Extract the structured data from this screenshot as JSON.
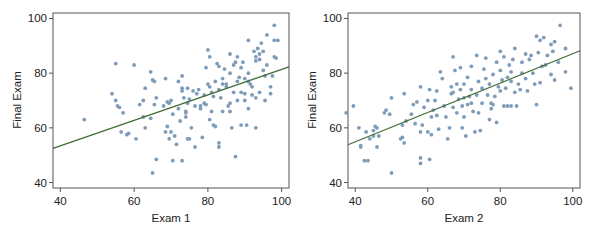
{
  "chart_data": [
    {
      "type": "scatter",
      "title": "",
      "xlabel": "Exam 1",
      "ylabel": "Final Exam",
      "xlim": [
        38,
        102
      ],
      "ylim": [
        38,
        102
      ],
      "xticks": [
        40,
        60,
        80,
        100
      ],
      "yticks": [
        40,
        60,
        80,
        100
      ],
      "grid": false,
      "legend": null,
      "point_color": "#7e9cb8",
      "line_color": "#3f6b35",
      "regression_line": {
        "x": [
          38,
          102
        ],
        "y": [
          52.5,
          82.3
        ]
      },
      "points": [
        [
          46.5,
          63
        ],
        [
          54,
          72.5
        ],
        [
          55,
          83.5
        ],
        [
          55,
          70
        ],
        [
          55.5,
          68
        ],
        [
          56,
          67.5
        ],
        [
          57,
          65.5
        ],
        [
          56.5,
          58.5
        ],
        [
          58,
          57.5
        ],
        [
          58.5,
          58
        ],
        [
          60,
          83
        ],
        [
          60.5,
          56
        ],
        [
          61.5,
          68.5
        ],
        [
          62.5,
          64
        ],
        [
          62.5,
          70
        ],
        [
          63,
          74.5
        ],
        [
          63,
          60
        ],
        [
          64.5,
          80.5
        ],
        [
          65,
          77.5
        ],
        [
          65.5,
          77
        ],
        [
          64.5,
          63.5
        ],
        [
          65.5,
          68.5
        ],
        [
          66,
          71
        ],
        [
          66,
          48.5
        ],
        [
          65,
          43.5
        ],
        [
          68,
          68
        ],
        [
          68.5,
          78
        ],
        [
          69,
          69.5
        ],
        [
          69.5,
          69
        ],
        [
          70,
          70
        ],
        [
          68.5,
          58.5
        ],
        [
          69,
          60.5
        ],
        [
          69.5,
          56
        ],
        [
          70,
          58.5
        ],
        [
          70.5,
          65
        ],
        [
          70.5,
          48
        ],
        [
          71,
          57
        ],
        [
          71.5,
          54
        ],
        [
          72,
          67
        ],
        [
          72,
          77
        ],
        [
          72.5,
          62.5
        ],
        [
          73,
          79
        ],
        [
          73,
          73.5
        ],
        [
          73,
          74.5
        ],
        [
          73.5,
          71
        ],
        [
          74,
          66
        ],
        [
          74,
          65.5
        ],
        [
          74.5,
          69
        ],
        [
          74.5,
          74.5
        ],
        [
          74,
          64
        ],
        [
          73,
          48
        ],
        [
          74.5,
          56
        ],
        [
          75,
          56
        ],
        [
          75.5,
          60
        ],
        [
          75,
          70.5
        ],
        [
          76,
          73.5
        ],
        [
          76.5,
          68
        ],
        [
          76.5,
          53
        ],
        [
          77,
          72.5
        ],
        [
          77.5,
          74
        ],
        [
          78,
          68
        ],
        [
          78.5,
          56.5
        ],
        [
          78,
          67
        ],
        [
          79,
          69
        ],
        [
          79.5,
          82
        ],
        [
          79,
          72
        ],
        [
          79.5,
          68.5
        ],
        [
          80,
          88.5
        ],
        [
          80,
          76
        ],
        [
          80.5,
          86
        ],
        [
          80.5,
          75
        ],
        [
          80.5,
          63
        ],
        [
          81,
          73
        ],
        [
          81,
          66
        ],
        [
          81.5,
          71.5
        ],
        [
          81.5,
          61
        ],
        [
          82,
          77
        ],
        [
          82,
          60.5
        ],
        [
          82.5,
          83.5
        ],
        [
          83,
          74
        ],
        [
          83,
          82.5
        ],
        [
          83,
          53
        ],
        [
          83,
          54.5
        ],
        [
          83.5,
          71
        ],
        [
          84,
          78
        ],
        [
          84,
          76
        ],
        [
          84,
          66
        ],
        [
          84.5,
          81.5
        ],
        [
          85,
          76
        ],
        [
          85,
          75
        ],
        [
          85.5,
          68
        ],
        [
          86,
          87
        ],
        [
          86,
          80
        ],
        [
          86,
          69
        ],
        [
          86,
          66
        ],
        [
          86.5,
          60
        ],
        [
          87,
          83
        ],
        [
          87,
          73
        ],
        [
          87.5,
          84
        ],
        [
          87.5,
          49.5
        ],
        [
          88,
          86
        ],
        [
          88,
          77
        ],
        [
          88,
          70
        ],
        [
          88.5,
          78.5
        ],
        [
          89,
          82
        ],
        [
          89,
          73
        ],
        [
          89,
          61
        ],
        [
          89.5,
          84
        ],
        [
          90,
          78
        ],
        [
          90,
          72.5
        ],
        [
          90,
          70
        ],
        [
          90.5,
          61
        ],
        [
          91,
          92
        ],
        [
          91,
          80
        ],
        [
          91,
          77
        ],
        [
          91,
          67
        ],
        [
          91.5,
          76
        ],
        [
          92,
          75
        ],
        [
          92,
          72
        ],
        [
          92.5,
          88
        ],
        [
          93,
          86
        ],
        [
          93,
          84.5
        ],
        [
          93,
          71
        ],
        [
          93,
          60
        ],
        [
          93.5,
          89
        ],
        [
          94,
          87
        ],
        [
          94,
          85
        ],
        [
          94,
          73
        ],
        [
          94.5,
          91
        ],
        [
          95,
          88
        ],
        [
          95,
          81
        ],
        [
          95.5,
          79
        ],
        [
          95.5,
          70
        ],
        [
          96,
          94
        ],
        [
          96,
          83
        ],
        [
          97,
          72.5
        ],
        [
          97,
          75
        ],
        [
          97.5,
          79
        ],
        [
          98,
          97.5
        ],
        [
          98,
          86
        ],
        [
          98,
          92
        ],
        [
          98.5,
          85.5
        ],
        [
          99,
          92
        ]
      ]
    },
    {
      "type": "scatter",
      "title": "",
      "xlabel": "Exam 2",
      "ylabel": "Final Exam",
      "xlim": [
        38,
        102
      ],
      "ylim": [
        38,
        102
      ],
      "xticks": [
        40,
        60,
        80,
        100
      ],
      "yticks": [
        40,
        60,
        80,
        100
      ],
      "grid": false,
      "legend": null,
      "point_color": "#7e9cb8",
      "line_color": "#3f6b35",
      "regression_line": {
        "x": [
          38,
          102
        ],
        "y": [
          53.8,
          88.2
        ]
      },
      "points": [
        [
          37.5,
          65.5
        ],
        [
          39.5,
          68
        ],
        [
          41,
          60
        ],
        [
          41.5,
          53.5
        ],
        [
          41.5,
          53
        ],
        [
          42.5,
          48
        ],
        [
          43,
          58.5
        ],
        [
          43.5,
          48
        ],
        [
          44,
          56
        ],
        [
          45,
          57
        ],
        [
          45,
          59
        ],
        [
          45.5,
          60.5
        ],
        [
          46,
          60
        ],
        [
          46,
          53
        ],
        [
          46.5,
          57
        ],
        [
          48,
          65.5
        ],
        [
          48.5,
          66.5
        ],
        [
          49.5,
          65
        ],
        [
          50,
          71
        ],
        [
          50,
          43.5
        ],
        [
          52.5,
          56
        ],
        [
          53,
          61
        ],
        [
          53,
          56.5
        ],
        [
          53.5,
          72.5
        ],
        [
          53.5,
          54.5
        ],
        [
          54,
          62.5
        ],
        [
          55.5,
          65
        ],
        [
          56,
          68.5
        ],
        [
          56.5,
          61.5
        ],
        [
          57,
          69.5
        ],
        [
          58,
          75
        ],
        [
          58,
          49
        ],
        [
          58,
          47
        ],
        [
          58,
          58.5
        ],
        [
          58.5,
          61
        ],
        [
          59,
          67.5
        ],
        [
          60,
          70
        ],
        [
          60,
          58.5
        ],
        [
          60.5,
          74
        ],
        [
          60.5,
          48.5
        ],
        [
          61,
          57.5
        ],
        [
          61,
          64
        ],
        [
          61.5,
          66.5
        ],
        [
          62,
          70
        ],
        [
          62.5,
          73.5
        ],
        [
          62.5,
          64.5
        ],
        [
          63,
          59.5
        ],
        [
          63.5,
          80.5
        ],
        [
          64,
          78
        ],
        [
          64.5,
          68
        ],
        [
          65,
          64
        ],
        [
          65.5,
          56
        ],
        [
          66,
          60
        ],
        [
          66.5,
          72.5
        ],
        [
          66.5,
          75
        ],
        [
          67,
          86
        ],
        [
          67,
          73
        ],
        [
          67,
          67.5
        ],
        [
          67.5,
          81
        ],
        [
          68,
          76
        ],
        [
          68,
          65.5
        ],
        [
          68.5,
          70.5
        ],
        [
          69,
          82
        ],
        [
          69,
          74
        ],
        [
          69.5,
          68
        ],
        [
          69.5,
          60
        ],
        [
          70,
          76
        ],
        [
          70,
          71
        ],
        [
          70,
          64
        ],
        [
          70.5,
          57
        ],
        [
          71,
          78.5
        ],
        [
          71,
          68.5
        ],
        [
          71.5,
          71.5
        ],
        [
          72,
          74
        ],
        [
          72,
          69
        ],
        [
          72,
          82.5
        ],
        [
          72.5,
          66
        ],
        [
          73,
          58.5
        ],
        [
          73.5,
          72
        ],
        [
          73.5,
          86.5
        ],
        [
          74,
          77
        ],
        [
          74,
          65.5
        ],
        [
          74.5,
          59
        ],
        [
          75,
          69
        ],
        [
          75,
          74.5
        ],
        [
          75.5,
          81.5
        ],
        [
          76,
          85.5
        ],
        [
          76,
          78
        ],
        [
          76.5,
          72
        ],
        [
          77,
          76
        ],
        [
          77,
          63
        ],
        [
          77.5,
          69
        ],
        [
          77.5,
          67
        ],
        [
          78,
          79.5
        ],
        [
          78,
          68.5
        ],
        [
          78.5,
          71.5
        ],
        [
          79,
          84
        ],
        [
          79,
          62
        ],
        [
          79.5,
          75
        ],
        [
          80,
          88
        ],
        [
          80,
          81
        ],
        [
          80,
          73.5
        ],
        [
          80.5,
          77.5
        ],
        [
          81,
          86
        ],
        [
          81,
          68
        ],
        [
          81.5,
          74.5
        ],
        [
          82,
          78.5
        ],
        [
          82,
          68
        ],
        [
          82.5,
          83
        ],
        [
          83,
          80.5
        ],
        [
          83,
          77
        ],
        [
          83,
          68
        ],
        [
          83.5,
          85
        ],
        [
          84,
          89
        ],
        [
          84,
          73
        ],
        [
          84.5,
          68
        ],
        [
          85,
          76
        ],
        [
          85.5,
          74
        ],
        [
          86,
          80
        ],
        [
          86,
          84
        ],
        [
          87,
          87
        ],
        [
          87,
          78
        ],
        [
          87.5,
          73.5
        ],
        [
          88,
          85
        ],
        [
          88.5,
          86.5
        ],
        [
          89,
          80
        ],
        [
          89.5,
          76
        ],
        [
          90,
          93.5
        ],
        [
          90,
          68.5
        ],
        [
          90.5,
          87.5
        ],
        [
          91,
          92
        ],
        [
          91,
          76.5
        ],
        [
          91.5,
          82.5
        ],
        [
          92,
          93
        ],
        [
          92.5,
          83
        ],
        [
          93,
          86.5
        ],
        [
          94,
          90.5
        ],
        [
          94,
          79.5
        ],
        [
          94.5,
          88
        ],
        [
          95,
          91.5
        ],
        [
          95,
          77.5
        ],
        [
          96,
          84
        ],
        [
          96.5,
          97.5
        ],
        [
          98,
          89
        ],
        [
          98,
          80.5
        ],
        [
          99.5,
          74.5
        ]
      ]
    }
  ],
  "panels": [
    {
      "xlabel": "Exam 1",
      "ylabel": "Final Exam",
      "xtick_labels": [
        "40",
        "60",
        "80",
        "100"
      ],
      "ytick_labels": [
        "40",
        "60",
        "80",
        "100"
      ]
    },
    {
      "xlabel": "Exam 2",
      "ylabel": "Final Exam",
      "xtick_labels": [
        "40",
        "60",
        "80",
        "100"
      ],
      "ytick_labels": [
        "40",
        "60",
        "80",
        "100"
      ]
    }
  ]
}
